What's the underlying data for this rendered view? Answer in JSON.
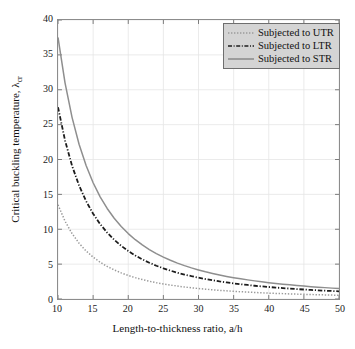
{
  "chart_data": {
    "type": "line",
    "title": "",
    "xlabel": "Length-to-thickness ratio, a/h",
    "ylabel_main": "Critical buckling temperature, ",
    "ylabel_symbol": "λ",
    "ylabel_subscript": "cr",
    "xlim": [
      10,
      50
    ],
    "ylim": [
      0,
      40
    ],
    "xticks": [
      10,
      15,
      20,
      25,
      30,
      35,
      40,
      45,
      50
    ],
    "yticks": [
      0,
      5,
      10,
      15,
      20,
      25,
      30,
      35,
      40
    ],
    "grid": true,
    "legend_position": "top-right",
    "x": [
      10,
      11,
      12,
      13,
      14,
      15,
      16,
      17,
      18,
      19,
      20,
      21,
      22,
      23,
      24,
      25,
      26,
      27,
      28,
      29,
      30,
      31,
      32,
      33,
      34,
      35,
      36,
      37,
      38,
      39,
      40,
      41,
      42,
      43,
      44,
      45,
      46,
      47,
      48,
      49,
      50
    ],
    "series": [
      {
        "name": "Subjected to UTR",
        "linestyle": "dotted",
        "color": "#9a9a9a",
        "values": [
          13.5,
          11.16,
          9.38,
          7.99,
          6.89,
          6.0,
          5.27,
          4.67,
          4.17,
          3.74,
          3.38,
          3.06,
          2.79,
          2.55,
          2.34,
          2.16,
          2.0,
          1.85,
          1.72,
          1.61,
          1.5,
          1.41,
          1.32,
          1.24,
          1.17,
          1.1,
          1.04,
          0.99,
          0.94,
          0.89,
          0.84,
          0.8,
          0.77,
          0.73,
          0.7,
          0.67,
          0.64,
          0.61,
          0.59,
          0.56,
          0.54
        ]
      },
      {
        "name": "Subjected to LTR",
        "linestyle": "dashdot",
        "color": "#1c1c1c",
        "values": [
          27.5,
          22.73,
          19.1,
          16.27,
          14.03,
          12.22,
          10.74,
          9.52,
          8.49,
          7.62,
          6.88,
          6.24,
          5.68,
          5.2,
          4.77,
          4.4,
          4.07,
          3.77,
          3.51,
          3.27,
          3.06,
          2.86,
          2.69,
          2.52,
          2.38,
          2.24,
          2.12,
          2.01,
          1.9,
          1.81,
          1.72,
          1.64,
          1.56,
          1.49,
          1.42,
          1.36,
          1.3,
          1.25,
          1.19,
          1.15,
          1.1
        ]
      },
      {
        "name": "Subjected to STR",
        "linestyle": "solid",
        "color": "#8e8e8e",
        "values": [
          37.5,
          30.99,
          26.04,
          22.19,
          19.13,
          16.67,
          14.65,
          12.98,
          11.57,
          10.39,
          9.38,
          8.5,
          7.75,
          7.09,
          6.51,
          6.0,
          5.55,
          5.14,
          4.78,
          4.46,
          4.17,
          3.9,
          3.66,
          3.44,
          3.24,
          3.06,
          2.89,
          2.74,
          2.6,
          2.47,
          2.34,
          2.23,
          2.13,
          2.03,
          1.94,
          1.85,
          1.77,
          1.7,
          1.63,
          1.56,
          1.5
        ]
      }
    ]
  },
  "legend": {
    "items": [
      {
        "label": "Subjected to UTR"
      },
      {
        "label": "Subjected to LTR"
      },
      {
        "label": "Subjected to STR"
      }
    ]
  }
}
